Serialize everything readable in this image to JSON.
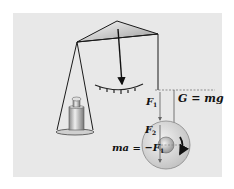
{
  "diagram": {
    "type": "physics-balance-with-rotating-wheel",
    "labels": {
      "gravity_label": "G = mg",
      "force_f1_main": "F",
      "force_f1_sub": "1",
      "force_f2_main": "F",
      "force_f2_sub": "2",
      "inertial_prefix": "ma = −",
      "inertial_force_main": "F",
      "inertial_force_sub": "1"
    },
    "colors": {
      "background": "#e8e8e8",
      "lines": "#1a1a1a",
      "wheel_fill": "#d8d8d8",
      "dashed": "#555555"
    }
  }
}
